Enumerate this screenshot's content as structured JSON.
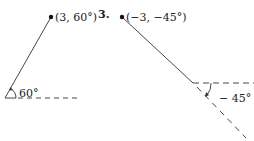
{
  "figure": {
    "left_panel": {
      "point_label": "(3, 60°)",
      "angle_label": "60°"
    },
    "right_panel": {
      "problem_number": "3.",
      "point_label": "(−3, −45°)",
      "angle_label": "− 45°"
    },
    "colors": {
      "ink": "#222222",
      "background": "#ffffff"
    }
  }
}
